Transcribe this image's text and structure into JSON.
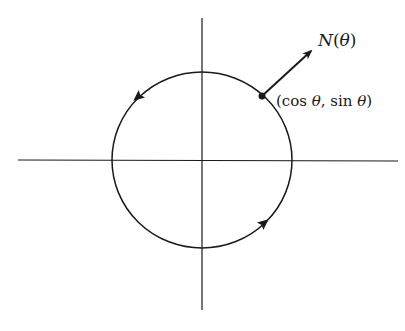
{
  "figure": {
    "type": "unit-circle-normal-vector",
    "labels": {
      "normal_N": "N",
      "normal_open": "(",
      "normal_theta": "θ",
      "normal_close": ")",
      "point_open": "(cos ",
      "point_theta1": "θ",
      "point_mid": ", sin ",
      "point_theta2": "θ",
      "point_close": ")"
    },
    "elements": {
      "axes": [
        "horizontal-axis",
        "vertical-axis"
      ],
      "circle": "counterclockwise-oriented circle",
      "orientation_arrows": 2,
      "point": "(cos θ, sin θ)",
      "normal_vector": "N(θ)"
    },
    "colors": {
      "stroke": "#1a1a1a",
      "background": "#ffffff"
    }
  }
}
